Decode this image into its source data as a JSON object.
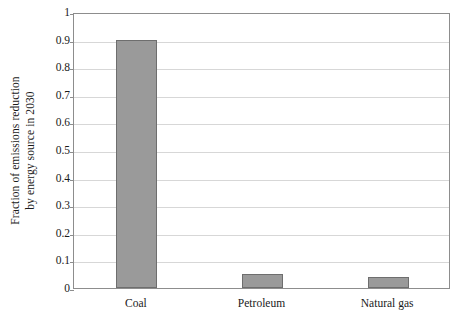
{
  "chart_data": {
    "type": "bar",
    "title": "",
    "xlabel": "",
    "ylabel": "Fraction of emissions reduction by energy source in 2030",
    "ylabel_lines": [
      "Fraction of emissions reduction",
      "by energy source in 2030"
    ],
    "categories": [
      "Coal",
      "Petroleum",
      "Natural gas"
    ],
    "values": [
      0.9,
      0.05,
      0.04
    ],
    "ylim": [
      0,
      1
    ],
    "ytick_labels": [
      "0",
      "0.1",
      "0.2",
      "0.3",
      "0.4",
      "0.5",
      "0.6",
      "0.7",
      "0.8",
      "0.9",
      "1"
    ],
    "ytick_values": [
      0,
      0.1,
      0.2,
      0.3,
      0.4,
      0.5,
      0.6,
      0.7,
      0.8,
      0.9,
      1
    ],
    "grid": true,
    "legend": "none",
    "colors": {
      "bar_fill": "#9a9a9a",
      "bar_border": "#6e6e6e",
      "gridline": "#d7d7d7",
      "axis": "#8d8d8d",
      "background": "#ffffff",
      "text": "#1a1a1a"
    }
  }
}
